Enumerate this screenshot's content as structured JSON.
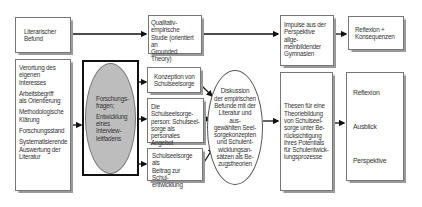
{
  "diagram": {
    "literary_finding": {
      "lines": [
        "Literarischer",
        "Befund"
      ]
    },
    "qualitative_study": {
      "lines": [
        "Qualitativ-empirische",
        "Studie (orientiert an",
        "Grounded Theory)"
      ]
    },
    "impulses": {
      "lines": [
        "Impulse aus der",
        "Perspektive allge-",
        "meinbildender",
        "Gymnasien"
      ]
    },
    "reflection_consequences": {
      "lines": [
        "Reflexion +",
        "Konsequenzen"
      ]
    },
    "left_list": {
      "items": [
        [
          "Verortung des",
          "eigenen Interesses"
        ],
        [
          "Arbeitsbegriff",
          "als Orientierung"
        ],
        [
          "Methodologische",
          "Klärung"
        ],
        [
          "Forschungsstand"
        ],
        [
          "Systematisierende",
          "Auswertung der",
          "Literatur"
        ]
      ]
    },
    "research_questions": {
      "lines": [
        "Forschungs-",
        "fragen;",
        "Entwicklung",
        "eines Interview-",
        "leitfadens"
      ]
    },
    "concept_box": {
      "lines": [
        "Konzeption von",
        "Schulseelsorge"
      ]
    },
    "person_box": {
      "lines": [
        "Die Schulseelsorge-",
        "person: Schulseel-",
        "sorge als personales",
        "Angebot"
      ]
    },
    "contribution_box": {
      "lines": [
        "Schulseelsorge als",
        "Beitrag zur Schul-",
        "entwicklung"
      ]
    },
    "discussion": {
      "lines": [
        "Diskussion",
        "der empirischen",
        "Befunde mit der",
        "Literatur und aus-",
        "gewählten Seel-",
        "sorgekonzepten",
        "und Schulent-",
        "wicklungsan-",
        "sätzen als Be-",
        "zugstheorien"
      ]
    },
    "theses": {
      "lines": [
        "Thesen für eine",
        "Theoriebildung",
        "von Schulseel-",
        "sorge unter Be-",
        "rücksichtigung",
        "ihres Potentials",
        "für Schulentwick-",
        "lungsprozesse"
      ]
    },
    "outlook": {
      "items": [
        "Reflexion",
        "Ausblick",
        "Perspektive"
      ]
    }
  },
  "colors": {
    "gray_ellipse": "#bdbdbd",
    "border": "#777777",
    "arrow": "#111111"
  }
}
